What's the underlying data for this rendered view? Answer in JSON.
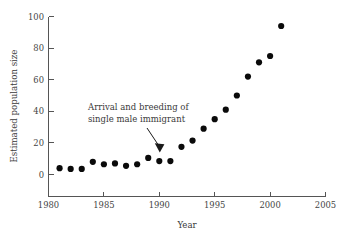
{
  "chart_data": {
    "type": "scatter",
    "title": "",
    "xlabel": "Year",
    "ylabel": "Estimated population size",
    "xlim": [
      1980,
      2005
    ],
    "ylim": [
      0,
      100
    ],
    "grid": false,
    "legend": null,
    "x_ticks": [
      1980,
      1985,
      1990,
      1995,
      2000,
      2005
    ],
    "y_ticks": [
      0,
      20,
      40,
      60,
      80,
      100
    ],
    "x_tick_labels": [
      "1980",
      "1985",
      "1990",
      "1995",
      "2000",
      "2005"
    ],
    "y_tick_labels": [
      "0",
      "20",
      "40",
      "60",
      "80",
      "100"
    ],
    "tick_direction": "in",
    "marker": {
      "shape": "circle",
      "color": "#0a0a0a",
      "size_px": 3.1
    },
    "series": [
      {
        "name": "Estimated population size",
        "x": [
          1981,
          1982,
          1983,
          1984,
          1985,
          1986,
          1987,
          1988,
          1989,
          1990,
          1991,
          1992,
          1993,
          1994,
          1995,
          1996,
          1997,
          1998,
          1999,
          2000,
          2001
        ],
        "values": [
          4,
          3.5,
          3.5,
          8,
          6.5,
          7,
          5.5,
          6.5,
          10.5,
          8.5,
          8.5,
          17.5,
          21.5,
          29,
          35,
          41,
          50,
          62,
          71,
          75,
          94
        ]
      }
    ],
    "annotations": [
      {
        "name": "arrival-annotation",
        "line1": "Arrival and breeding of",
        "line2": "single male immigrant",
        "points_to_x": 1991,
        "points_to_y": 15,
        "arrow": "down-right"
      }
    ]
  }
}
